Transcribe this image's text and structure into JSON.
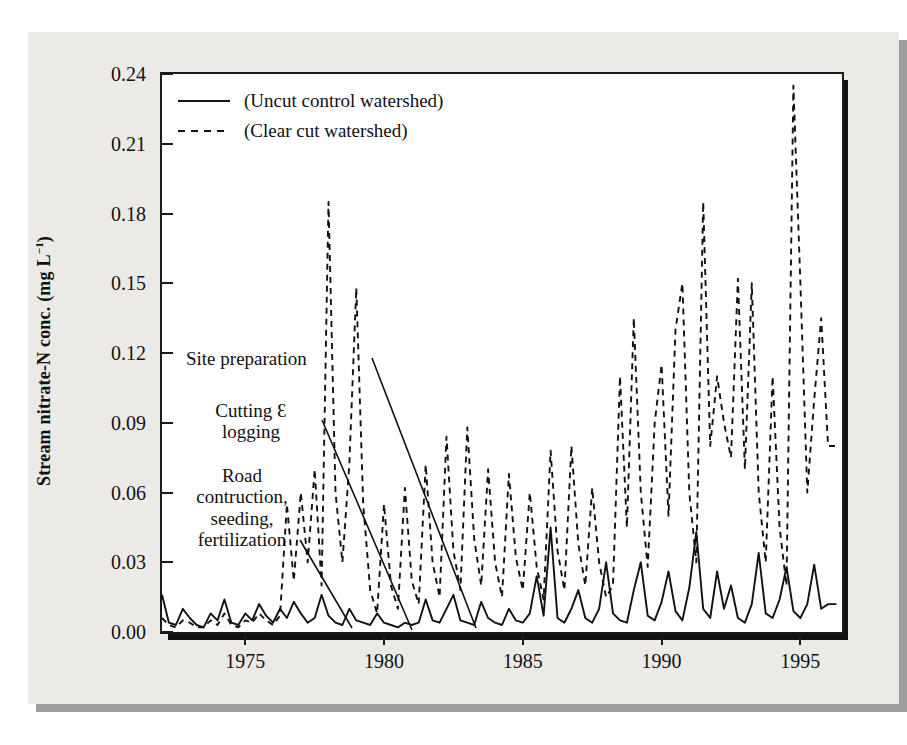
{
  "figure": {
    "panel_bg": "#eceae7",
    "plot_bg": "#ffffff",
    "ink": "#111111"
  },
  "axes": {
    "ylabel_main": "Stream nitrate-N conc. (mg L",
    "ylabel_sup": "−1",
    "ylabel_close": ")",
    "yticks": [
      "0.24",
      "0.21",
      "0.18",
      "0.15",
      "0.12",
      "0.09",
      "0.06",
      "0.03",
      "0.00"
    ],
    "xticks": [
      "1975",
      "1980",
      "1985",
      "1990",
      "1995"
    ]
  },
  "legend": {
    "items": [
      {
        "label": "(Uncut control watershed)",
        "style": "solid"
      },
      {
        "label": "(Clear cut watershed)",
        "style": "dashed"
      }
    ]
  },
  "annotations": {
    "site_preparation": "Site preparation",
    "cutting_logging_line1": "Cutting Ɛ",
    "cutting_logging_line2": "logging",
    "road_line1": "Road",
    "road_line2": "contruction,",
    "road_line3": "seeding,",
    "road_line4": "fertilization"
  },
  "chart_data": {
    "type": "line",
    "title": "",
    "xlabel": "",
    "ylabel": "Stream nitrate-N conc. (mg L-1)",
    "xlim": [
      1972.0,
      1996.5
    ],
    "ylim": [
      0.0,
      0.24
    ],
    "yticks": [
      0.0,
      0.03,
      0.06,
      0.09,
      0.12,
      0.15,
      0.18,
      0.21,
      0.24
    ],
    "xticks": [
      1975,
      1980,
      1985,
      1990,
      1995
    ],
    "grid": false,
    "legend_position": "upper-left-inside",
    "series": [
      {
        "name": "(Uncut control watershed)",
        "style": "solid",
        "color": "#111111",
        "x": [
          1972.0,
          1972.25,
          1972.5,
          1972.75,
          1973.0,
          1973.25,
          1973.5,
          1973.75,
          1974.0,
          1974.25,
          1974.5,
          1974.75,
          1975.0,
          1975.25,
          1975.5,
          1975.75,
          1976.0,
          1976.25,
          1976.5,
          1976.75,
          1977.0,
          1977.25,
          1977.5,
          1977.75,
          1978.0,
          1978.25,
          1978.5,
          1978.75,
          1979.0,
          1979.25,
          1979.5,
          1979.75,
          1980.0,
          1980.25,
          1980.5,
          1980.75,
          1981.0,
          1981.25,
          1981.5,
          1981.75,
          1982.0,
          1982.25,
          1982.5,
          1982.75,
          1983.0,
          1983.25,
          1983.5,
          1983.75,
          1984.0,
          1984.25,
          1984.5,
          1984.75,
          1985.0,
          1985.25,
          1985.5,
          1985.75,
          1986.0,
          1986.25,
          1986.5,
          1986.75,
          1987.0,
          1987.25,
          1987.5,
          1987.75,
          1988.0,
          1988.25,
          1988.5,
          1988.75,
          1989.0,
          1989.25,
          1989.5,
          1989.75,
          1990.0,
          1990.25,
          1990.5,
          1990.75,
          1991.0,
          1991.25,
          1991.5,
          1991.75,
          1992.0,
          1992.25,
          1992.5,
          1992.75,
          1993.0,
          1993.25,
          1993.5,
          1993.75,
          1994.0,
          1994.25,
          1994.5,
          1994.75,
          1995.0,
          1995.25,
          1995.5,
          1995.75,
          1996.0,
          1996.3
        ],
        "y": [
          0.016,
          0.004,
          0.003,
          0.01,
          0.006,
          0.003,
          0.002,
          0.008,
          0.005,
          0.014,
          0.004,
          0.003,
          0.008,
          0.005,
          0.012,
          0.007,
          0.004,
          0.01,
          0.006,
          0.013,
          0.008,
          0.004,
          0.006,
          0.016,
          0.007,
          0.004,
          0.003,
          0.01,
          0.005,
          0.004,
          0.003,
          0.008,
          0.004,
          0.003,
          0.002,
          0.004,
          0.003,
          0.004,
          0.014,
          0.005,
          0.004,
          0.01,
          0.016,
          0.005,
          0.004,
          0.003,
          0.013,
          0.006,
          0.004,
          0.003,
          0.01,
          0.005,
          0.004,
          0.008,
          0.024,
          0.007,
          0.045,
          0.006,
          0.004,
          0.01,
          0.018,
          0.006,
          0.004,
          0.01,
          0.03,
          0.008,
          0.005,
          0.004,
          0.018,
          0.03,
          0.007,
          0.005,
          0.013,
          0.026,
          0.009,
          0.005,
          0.019,
          0.043,
          0.01,
          0.006,
          0.026,
          0.01,
          0.02,
          0.006,
          0.004,
          0.012,
          0.034,
          0.008,
          0.006,
          0.014,
          0.028,
          0.009,
          0.006,
          0.012,
          0.029,
          0.01,
          0.012,
          0.012
        ]
      },
      {
        "name": "(Clear cut watershed)",
        "style": "dashed",
        "color": "#111111",
        "x": [
          1972.0,
          1972.25,
          1972.5,
          1972.75,
          1973.0,
          1973.25,
          1973.5,
          1973.75,
          1974.0,
          1974.25,
          1974.5,
          1974.75,
          1975.0,
          1975.25,
          1975.5,
          1975.75,
          1976.0,
          1976.25,
          1976.5,
          1976.75,
          1977.0,
          1977.25,
          1977.5,
          1977.75,
          1978.0,
          1978.25,
          1978.5,
          1978.75,
          1979.0,
          1979.25,
          1979.5,
          1979.75,
          1980.0,
          1980.25,
          1980.5,
          1980.75,
          1981.0,
          1981.25,
          1981.5,
          1981.75,
          1982.0,
          1982.25,
          1982.5,
          1982.75,
          1983.0,
          1983.25,
          1983.5,
          1983.75,
          1984.0,
          1984.25,
          1984.5,
          1984.75,
          1985.0,
          1985.25,
          1985.5,
          1985.75,
          1986.0,
          1986.25,
          1986.5,
          1986.75,
          1987.0,
          1987.25,
          1987.5,
          1987.75,
          1988.0,
          1988.25,
          1988.5,
          1988.75,
          1989.0,
          1989.25,
          1989.5,
          1989.75,
          1990.0,
          1990.25,
          1990.5,
          1990.75,
          1991.0,
          1991.25,
          1991.5,
          1991.75,
          1992.0,
          1992.25,
          1992.5,
          1992.75,
          1993.0,
          1993.25,
          1993.5,
          1993.75,
          1994.0,
          1994.25,
          1994.5,
          1994.75,
          1995.0,
          1995.25,
          1995.5,
          1995.75,
          1996.0,
          1996.3
        ],
        "y": [
          0.006,
          0.003,
          0.002,
          0.005,
          0.004,
          0.002,
          0.002,
          0.005,
          0.003,
          0.008,
          0.003,
          0.002,
          0.005,
          0.004,
          0.008,
          0.005,
          0.003,
          0.007,
          0.055,
          0.022,
          0.06,
          0.03,
          0.07,
          0.02,
          0.185,
          0.06,
          0.03,
          0.072,
          0.148,
          0.055,
          0.018,
          0.008,
          0.055,
          0.02,
          0.01,
          0.062,
          0.022,
          0.012,
          0.072,
          0.03,
          0.015,
          0.084,
          0.035,
          0.018,
          0.088,
          0.04,
          0.02,
          0.07,
          0.03,
          0.015,
          0.068,
          0.032,
          0.018,
          0.06,
          0.028,
          0.014,
          0.078,
          0.035,
          0.018,
          0.08,
          0.038,
          0.02,
          0.062,
          0.03,
          0.015,
          0.02,
          0.11,
          0.045,
          0.135,
          0.06,
          0.028,
          0.09,
          0.115,
          0.05,
          0.13,
          0.15,
          0.06,
          0.03,
          0.185,
          0.08,
          0.11,
          0.09,
          0.075,
          0.152,
          0.07,
          0.15,
          0.06,
          0.03,
          0.11,
          0.045,
          0.02,
          0.235,
          0.15,
          0.06,
          0.1,
          0.135,
          0.08,
          0.08
        ]
      }
    ]
  }
}
